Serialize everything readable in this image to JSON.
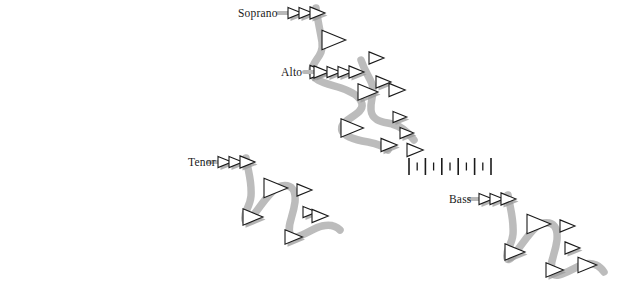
{
  "figure": {
    "background_color": "#ffffff",
    "width": 636,
    "height": 292,
    "ribbon_color": "#b8b8b8",
    "ribbon_color_dark": "#a8a8a8",
    "note_outline_color": "#1a1a1a",
    "note_fill_color": "#ffffff",
    "note_shadow_color": "#9a9a9a",
    "label_color": "#1a1a1a"
  },
  "voices": [
    {
      "id": "soprano",
      "label": "Soprano",
      "label_x": 238,
      "label_y": 17,
      "label_anchor": "start",
      "stem_x": 292,
      "stem_y": 13,
      "notes": [
        {
          "x": 288,
          "y": 13,
          "size": 11,
          "shadow": true
        },
        {
          "x": 299,
          "y": 13,
          "size": 11,
          "shadow": true
        },
        {
          "x": 310,
          "y": 13,
          "size": 12,
          "shadow": true
        },
        {
          "x": 322,
          "y": 40,
          "size": 19,
          "shadow": false
        },
        {
          "x": 310,
          "y": 72,
          "size": 13,
          "shadow": true
        },
        {
          "x": 358,
          "y": 92,
          "size": 16,
          "shadow": true
        },
        {
          "x": 341,
          "y": 128,
          "size": 18,
          "shadow": false
        },
        {
          "x": 381,
          "y": 145,
          "size": 13,
          "shadow": true
        }
      ],
      "ribbon": "M 316,8 C 318,22 320,30 322,42 C 324,56 313,60 312,70 C 311,82 330,84 341,88 C 352,92 360,96 362,104 C 364,114 345,118 342,126 C 339,136 356,140 368,142 C 378,144 384,146 388,150"
    },
    {
      "id": "alto",
      "label": "Alto",
      "label_x": 281,
      "label_y": 76,
      "label_anchor": "start",
      "stem_x": 318,
      "stem_y": 72,
      "notes": [
        {
          "x": 314,
          "y": 72,
          "size": 12,
          "shadow": true
        },
        {
          "x": 327,
          "y": 72,
          "size": 11,
          "shadow": true
        },
        {
          "x": 338,
          "y": 72,
          "size": 11,
          "shadow": true
        },
        {
          "x": 349,
          "y": 72,
          "size": 12,
          "shadow": true
        },
        {
          "x": 369,
          "y": 58,
          "size": 12,
          "shadow": false
        },
        {
          "x": 376,
          "y": 82,
          "size": 12,
          "shadow": true
        },
        {
          "x": 389,
          "y": 90,
          "size": 13,
          "shadow": false
        },
        {
          "x": 393,
          "y": 117,
          "size": 11,
          "shadow": true
        },
        {
          "x": 400,
          "y": 133,
          "size": 11,
          "shadow": true
        },
        {
          "x": 407,
          "y": 150,
          "size": 13,
          "shadow": false
        }
      ],
      "ribbon": "M 361,60 C 365,72 369,76 372,84 C 375,94 370,100 371,110 C 372,122 385,122 392,124 C 400,126 408,132 414,140"
    },
    {
      "id": "tenor",
      "label": "Tenor",
      "label_x": 188,
      "label_y": 166,
      "label_anchor": "start",
      "stem_x": 222,
      "stem_y": 162,
      "notes": [
        {
          "x": 218,
          "y": 162,
          "size": 11,
          "shadow": true
        },
        {
          "x": 229,
          "y": 162,
          "size": 11,
          "shadow": true
        },
        {
          "x": 240,
          "y": 162,
          "size": 12,
          "shadow": true
        },
        {
          "x": 264,
          "y": 188,
          "size": 19,
          "shadow": false
        },
        {
          "x": 243,
          "y": 217,
          "size": 16,
          "shadow": true
        },
        {
          "x": 297,
          "y": 190,
          "size": 12,
          "shadow": false
        },
        {
          "x": 303,
          "y": 212,
          "size": 11,
          "shadow": true
        },
        {
          "x": 312,
          "y": 216,
          "size": 13,
          "shadow": false
        },
        {
          "x": 285,
          "y": 237,
          "size": 14,
          "shadow": true
        }
      ],
      "ribbon": "M 246,158 C 249,175 252,182 251,196 C 250,208 243,212 245,220 C 248,230 268,188 281,186 C 292,184 296,190 295,202 C 293,218 287,224 290,234 C 293,244 312,228 322,226 C 330,224 336,226 340,230"
    },
    {
      "id": "bass",
      "label": "Bass",
      "label_x": 449,
      "label_y": 203,
      "label_anchor": "start",
      "stem_x": 483,
      "stem_y": 199,
      "notes": [
        {
          "x": 479,
          "y": 199,
          "size": 11,
          "shadow": true
        },
        {
          "x": 490,
          "y": 199,
          "size": 11,
          "shadow": true
        },
        {
          "x": 501,
          "y": 199,
          "size": 12,
          "shadow": true
        },
        {
          "x": 527,
          "y": 224,
          "size": 19,
          "shadow": false
        },
        {
          "x": 505,
          "y": 252,
          "size": 16,
          "shadow": true
        },
        {
          "x": 560,
          "y": 226,
          "size": 12,
          "shadow": false
        },
        {
          "x": 565,
          "y": 248,
          "size": 12,
          "shadow": true
        },
        {
          "x": 578,
          "y": 265,
          "size": 15,
          "shadow": false
        },
        {
          "x": 546,
          "y": 270,
          "size": 14,
          "shadow": true
        }
      ],
      "ribbon": "M 508,195 C 511,212 514,220 513,234 C 512,246 505,250 507,258 C 510,268 530,225 543,223 C 554,221 558,228 557,240 C 555,256 549,262 552,272 C 555,282 575,266 585,264 C 593,262 600,266 604,272"
    }
  ],
  "ruler": {
    "id": "tick-ruler",
    "x": 409,
    "y": 158,
    "tall_height": 17,
    "short_height": 8,
    "spacing": 8.2,
    "tick_color": "#1a1a1a",
    "ticks": [
      "tall",
      "short",
      "tall",
      "short",
      "tall",
      "short",
      "tall",
      "short",
      "tall",
      "short",
      "tall"
    ]
  }
}
